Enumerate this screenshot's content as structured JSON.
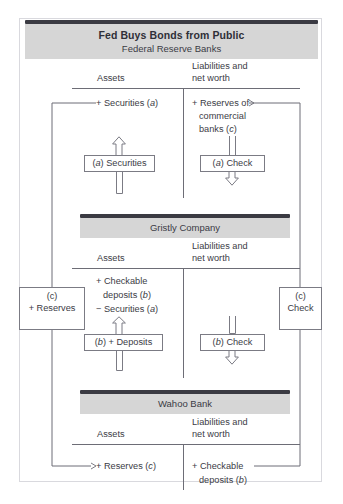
{
  "figure": {
    "title": "Fed Buys Bonds from Public",
    "subtitle": "Federal Reserve Banks",
    "accent_dark": "#3a3a42",
    "banner_bg": "#d6d6d6",
    "line_color": "#6d6d76"
  },
  "sections": [
    {
      "id": "fed",
      "name": "Federal Reserve Banks",
      "title": "Fed Buys Bonds from Public",
      "subtitle": "Federal Reserve Banks",
      "assets_header": "Assets",
      "liabilities_header_line1": "Liabilities and",
      "liabilities_header_line2": "net worth",
      "assets_entries": [
        "+ Securities (a)"
      ],
      "liabilities_entries": [
        "+ Reserves of",
        "commercial",
        "banks (c)"
      ],
      "asset_box": "(a) Securities",
      "liability_box": "(a) Check"
    },
    {
      "id": "gristly",
      "name": "Gristly Company",
      "title": "Gristly Company",
      "assets_header": "Assets",
      "liabilities_header_line1": "Liabilities and",
      "liabilities_header_line2": "net worth",
      "assets_entries": [
        "+ Checkable",
        "deposits (b)",
        "− Securities (a)"
      ],
      "liabilities_entries": [],
      "asset_box": "(b) + Deposits",
      "liability_box": "(b) Check"
    },
    {
      "id": "wahoo",
      "name": "Wahoo Bank",
      "title": "Wahoo Bank",
      "assets_header": "Assets",
      "liabilities_header_line1": "Liabilities and",
      "liabilities_header_line2": "net worth",
      "assets_entries": [
        "+ Reserves (c)"
      ],
      "liabilities_entries": [
        "+ Checkable",
        "deposits (b)"
      ]
    }
  ],
  "side_boxes": {
    "left": {
      "line1": "(c)",
      "line2": "+ Reserves"
    },
    "right": {
      "line1": "(c)",
      "line2": "Check"
    }
  },
  "text": {
    "fed_title": "Fed Buys Bonds from Public",
    "fed_subtitle": "Federal Reserve Banks",
    "gristly_title": "Gristly Company",
    "wahoo_title": "Wahoo Bank",
    "assets": "Assets",
    "liab_1": "Liabilities and",
    "liab_2": "net worth",
    "fed_asset_entry": "+ Securities (",
    "fed_asset_entry_it": "a",
    "fed_asset_entry_end": ")",
    "fed_liab_1": "+ Reserves of",
    "fed_liab_2": "commercial",
    "fed_liab_3a": "banks (",
    "fed_liab_3b": "c",
    "fed_liab_3c": ")",
    "fed_box_a_1": "(",
    "fed_box_a_2": "a",
    "fed_box_a_3": ") Securities",
    "fed_box_b_1": "(",
    "fed_box_b_2": "a",
    "fed_box_b_3": ") Check",
    "gr_asset_1": "+ Checkable",
    "gr_asset_2a": "deposits (",
    "gr_asset_2b": "b",
    "gr_asset_2c": ")",
    "gr_asset_3a": "− Securities (",
    "gr_asset_3b": "a",
    "gr_asset_3c": ")",
    "gr_box_a_1": "(",
    "gr_box_a_2": "b",
    "gr_box_a_3": ") + Deposits",
    "gr_box_b_1": "(",
    "gr_box_b_2": "b",
    "gr_box_b_3": ") Check",
    "wa_asset_1a": "+ Reserves (",
    "wa_asset_1b": "c",
    "wa_asset_1c": ")",
    "wa_liab_1": "+ Checkable",
    "wa_liab_2a": "deposits (",
    "wa_liab_2b": "b",
    "wa_liab_2c": ")",
    "left_box_1": "(c)",
    "left_box_2": "+ Reserves",
    "right_box_1": "(c)",
    "right_box_2": "Check"
  }
}
